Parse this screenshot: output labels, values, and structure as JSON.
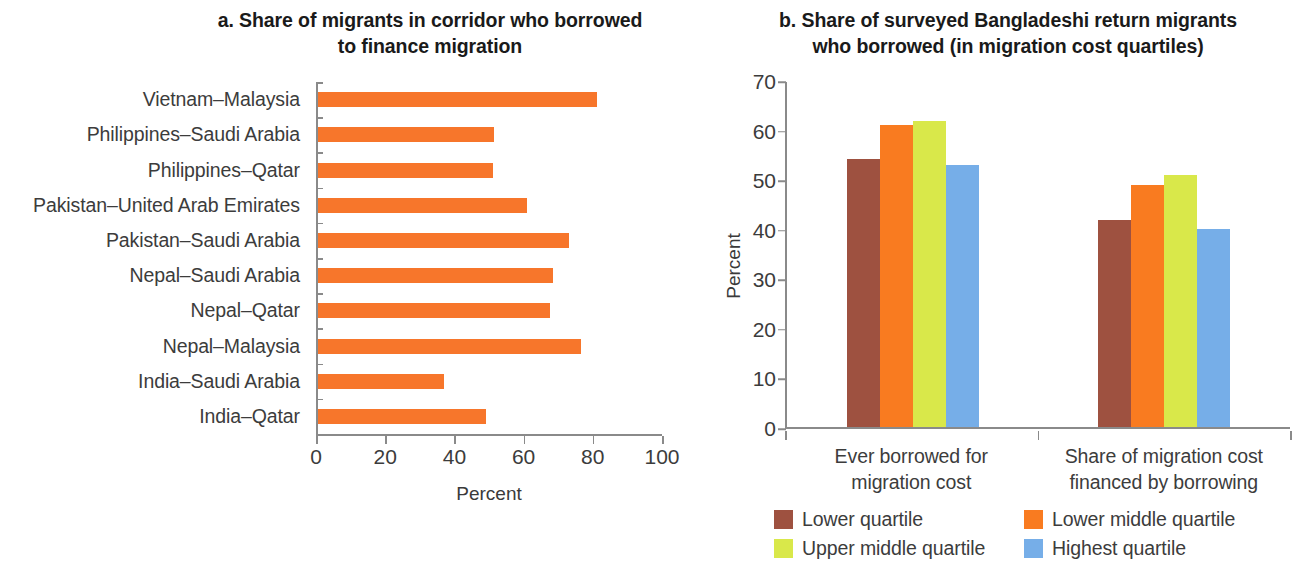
{
  "panel_a": {
    "title": "a. Share of migrants in corridor who borrowed to finance migration",
    "title_line1": "a. Share of migrants in corridor who borrowed",
    "title_line2": "to finance migration",
    "xaxis_title": "Percent",
    "bar_color": "#F7762B"
  },
  "panel_b": {
    "title": "b. Share of surveyed Bangladeshi return migrants who borrowed (in migration cost quartiles)",
    "title_line1": "b. Share of surveyed Bangladeshi return migrants",
    "title_line2": "who borrowed (in migration cost quartiles)",
    "yaxis_title": "Percent",
    "legend": [
      {
        "label": "Lower quartile",
        "color": "#9E5140"
      },
      {
        "label": "Lower middle quartile",
        "color": "#F97B20"
      },
      {
        "label": "Upper middle quartile",
        "color": "#D9E84A"
      },
      {
        "label": "Highest quartile",
        "color": "#76AEE8"
      }
    ]
  },
  "chart_data": [
    {
      "type": "bar",
      "orientation": "horizontal",
      "title": "a. Share of migrants in corridor who borrowed to finance migration",
      "xlabel": "Percent",
      "ylabel": "",
      "xlim": [
        0,
        100
      ],
      "xticks": [
        0,
        20,
        40,
        60,
        80,
        100
      ],
      "grid": false,
      "categories": [
        "Vietnam–Malaysia",
        "Philippines–Saudi Arabia",
        "Philippines–Qatar",
        "Pakistan–United Arab Emirates",
        "Pakistan–Saudi Arabia",
        "Nepal–Saudi Arabia",
        "Nepal–Qatar",
        "Nepal–Malaysia",
        "India–Saudi Arabia",
        "India–Qatar"
      ],
      "values": [
        80.5,
        51,
        50.5,
        60.5,
        72.5,
        68,
        67,
        76,
        36.5,
        48.5
      ],
      "color": "#F7762B"
    },
    {
      "type": "bar",
      "orientation": "vertical",
      "title": "b. Share of surveyed Bangladeshi return migrants who borrowed (in migration cost quartiles)",
      "xlabel": "",
      "ylabel": "Percent",
      "ylim": [
        0,
        70
      ],
      "yticks": [
        0,
        10,
        20,
        30,
        40,
        50,
        60,
        70
      ],
      "grid": false,
      "legend_position": "bottom",
      "categories": [
        "Ever borrowed for migration cost",
        "Share of migration cost financed by borrowing"
      ],
      "series": [
        {
          "name": "Lower quartile",
          "color": "#9E5140",
          "values": [
            54.0,
            41.8
          ]
        },
        {
          "name": "Lower middle quartile",
          "color": "#F97B20",
          "values": [
            61.0,
            48.9
          ]
        },
        {
          "name": "Upper middle quartile",
          "color": "#D9E84A",
          "values": [
            61.8,
            50.8
          ]
        },
        {
          "name": "Highest quartile",
          "color": "#76AEE8",
          "values": [
            52.8,
            39.9
          ]
        }
      ]
    }
  ]
}
